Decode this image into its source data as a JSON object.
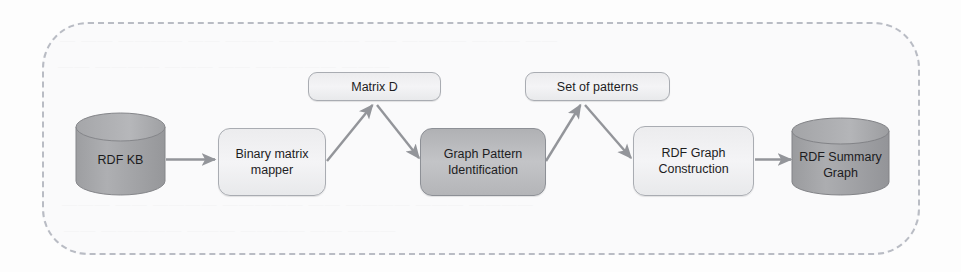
{
  "figure": {
    "kind": "pipeline-flow-diagram",
    "frame_label": "",
    "colors": {
      "page_background": "#fdfdfd",
      "frame_border": "#b9bcc4",
      "frame_fill": "#f7f8fa",
      "node_light_fill": "#eeeff1",
      "node_dark_fill": "#c0c1c4",
      "cylinder_fill": "#a9aaad",
      "arrow": "#95979c",
      "text": "#1d1d1f"
    }
  },
  "nodes": [
    {
      "id": "rdf-kb",
      "label": "RDF KB",
      "shape": "cylinder",
      "tone": "dark"
    },
    {
      "id": "binary-matrix-mapper",
      "label": "Binary matrix\nmapper",
      "shape": "box",
      "tone": "light"
    },
    {
      "id": "matrix-d",
      "label": "Matrix D",
      "shape": "pill",
      "tone": "light"
    },
    {
      "id": "graph-pattern-identification",
      "label": "Graph Pattern\nIdentification",
      "shape": "box",
      "tone": "dark"
    },
    {
      "id": "set-of-patterns",
      "label": "Set of patterns",
      "shape": "pill",
      "tone": "light"
    },
    {
      "id": "rdf-graph-construction",
      "label": "RDF Graph\nConstruction",
      "shape": "box",
      "tone": "light"
    },
    {
      "id": "rdf-summary-graph",
      "label": "RDF Summary\nGraph",
      "shape": "cylinder",
      "tone": "dark"
    }
  ],
  "node_labels": {
    "rdf_kb": "RDF KB",
    "binary_matrix_mapper_line1": "Binary matrix",
    "binary_matrix_mapper_line2": "mapper",
    "matrix_d": "Matrix D",
    "graph_pattern_identification_line1": "Graph Pattern",
    "graph_pattern_identification_line2": "Identification",
    "set_of_patterns": "Set of patterns",
    "rdf_graph_construction_line1": "RDF Graph",
    "rdf_graph_construction_line2": "Construction",
    "rdf_summary_graph_line1": "RDF Summary",
    "rdf_summary_graph_line2": "Graph"
  },
  "edges": [
    {
      "id": "e1",
      "from": "rdf-kb",
      "to": "binary-matrix-mapper",
      "label": "",
      "style": "straight"
    },
    {
      "id": "e2",
      "from": "binary-matrix-mapper",
      "to": "matrix-d",
      "label": "",
      "style": "diagonal-up"
    },
    {
      "id": "e3",
      "from": "matrix-d",
      "to": "graph-pattern-identification",
      "label": "",
      "style": "diagonal-down"
    },
    {
      "id": "e4",
      "from": "graph-pattern-identification",
      "to": "set-of-patterns",
      "label": "",
      "style": "diagonal-up"
    },
    {
      "id": "e5",
      "from": "set-of-patterns",
      "to": "rdf-graph-construction",
      "label": "",
      "style": "diagonal-down"
    },
    {
      "id": "e6",
      "from": "rdf-graph-construction",
      "to": "rdf-summary-graph",
      "label": "",
      "style": "straight"
    }
  ],
  "background_bleed": {
    "line1": "— ——  ————  ——  ———  —————  ——  ————  ———  ——",
    "line2": "——  ————  ———  ——  —————  ———",
    "line3": "———  ——  ————  —————  ——  ————  ———  ————",
    "line4": "——  —————  ———  ————  ——  ———"
  }
}
